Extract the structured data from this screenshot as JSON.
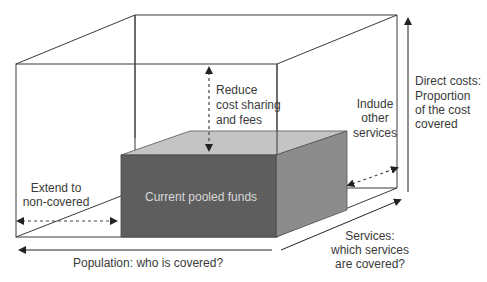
{
  "diagram": {
    "inner_box_label": "Current pooled funds",
    "labels": {
      "reduce": [
        "Reduce",
        "cost sharing",
        "and fees"
      ],
      "include": [
        "Indude",
        "other",
        "services"
      ],
      "extend": [
        "Extend to",
        "non-covered"
      ],
      "direct_costs": [
        "Direct costs:",
        "Proportion",
        "of the cost",
        "covered"
      ],
      "services": [
        "Services:",
        "which services",
        "are covered?"
      ],
      "population": "Population: who is covered?"
    },
    "colors": {
      "outline": "#3a3a3a",
      "front_face": "#5e5e5e",
      "side_face": "#8c8c8c",
      "top_face": "#c4c4c4",
      "text": "#3a3a3a",
      "box_text": "#d8d8d8"
    }
  }
}
